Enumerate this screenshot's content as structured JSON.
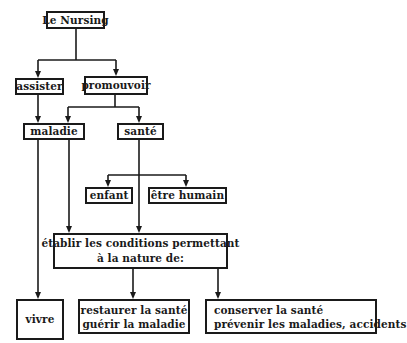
{
  "diagram": {
    "nodes": {
      "root": {
        "lines": [
          "Le Nursing"
        ]
      },
      "assister": {
        "lines": [
          "assister"
        ]
      },
      "promouvoir": {
        "lines": [
          "promouvoir"
        ]
      },
      "maladie": {
        "lines": [
          "maladie"
        ]
      },
      "sante": {
        "lines": [
          "santé"
        ]
      },
      "enfant": {
        "lines": [
          "enfant"
        ]
      },
      "etre_humain": {
        "lines": [
          "être humain"
        ]
      },
      "etablir": {
        "lines": [
          "établir les conditions permettant",
          "à la nature de:"
        ]
      },
      "vivre": {
        "lines": [
          "vivre"
        ]
      },
      "restaurer": {
        "lines": [
          "restaurer la santé",
          "guérir la maladie"
        ]
      },
      "conserver": {
        "lines": [
          "conserver la santé",
          "prévenir les maladies, accidents"
        ]
      }
    },
    "edges": [
      {
        "from": "Le Nursing",
        "to": "assister"
      },
      {
        "from": "Le Nursing",
        "to": "promouvoir"
      },
      {
        "from": "assister",
        "to": "maladie"
      },
      {
        "from": "promouvoir",
        "to": "maladie"
      },
      {
        "from": "promouvoir",
        "to": "santé"
      },
      {
        "from": "santé",
        "to": "enfant"
      },
      {
        "from": "santé",
        "to": "être humain"
      },
      {
        "from": "santé",
        "to": "établir les conditions permettant à la nature de:"
      },
      {
        "from": "maladie",
        "to": "vivre"
      },
      {
        "from": "maladie",
        "to": "établir les conditions permettant à la nature de:"
      },
      {
        "from": "établir les conditions permettant à la nature de:",
        "to": "restaurer la santé / guérir la maladie"
      },
      {
        "from": "établir les conditions permettant à la nature de:",
        "to": "conserver la santé / prévenir les maladies, accidents"
      }
    ],
    "stroke_color": "#1a1a1a",
    "background": "#ffffff"
  }
}
